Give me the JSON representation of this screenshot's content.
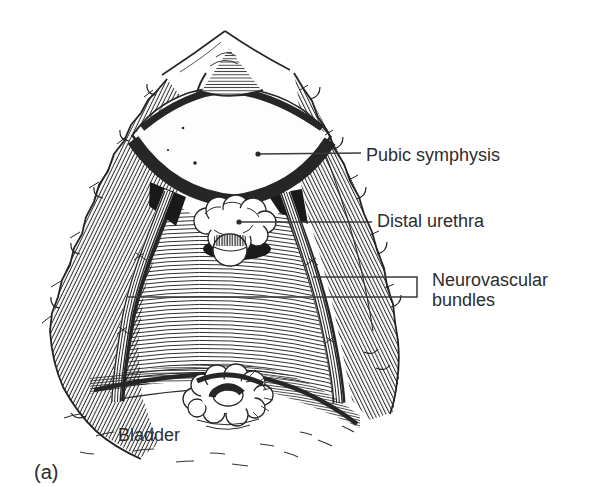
{
  "figure": {
    "type": "anatomical-line-illustration",
    "caption_label": "(a)",
    "labels": {
      "pubic_symphysis": "Pubic symphysis",
      "distal_urethra": "Distal urethra",
      "neurovascular_line1": "Neurovascular",
      "neurovascular_line2": "bundles",
      "bladder": "Bladder"
    },
    "colors": {
      "ink": "#262626",
      "background": "#ffffff",
      "label_text": "#2d2d2d"
    }
  }
}
